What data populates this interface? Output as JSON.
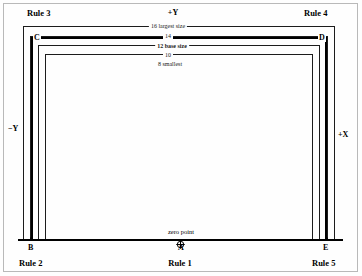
{
  "diagram": {
    "axes": {
      "top": "+Y",
      "left": "−Y",
      "right": "+X"
    },
    "origin": {
      "caption": "zero point",
      "marker": "crosshair-circle-icon",
      "letter": "A"
    },
    "corners": [
      {
        "letter": "C",
        "position": "top-left"
      },
      {
        "letter": "D",
        "position": "top-right"
      },
      {
        "letter": "B",
        "position": "bottom-left"
      },
      {
        "letter": "A",
        "position": "bottom-center"
      },
      {
        "letter": "E",
        "position": "bottom-right"
      }
    ],
    "rules": [
      {
        "id": "rule-1",
        "label": "Rule 1"
      },
      {
        "id": "rule-2",
        "label": "Rule 2"
      },
      {
        "id": "rule-3",
        "label": "Rule 3"
      },
      {
        "id": "rule-4",
        "label": "Rule 4"
      },
      {
        "id": "rule-5",
        "label": "Rule 5"
      }
    ],
    "sizes": [
      {
        "value": "16",
        "label": "16 largest size",
        "emphasis": "normal"
      },
      {
        "value": "14",
        "label": "14",
        "emphasis": "normal"
      },
      {
        "value": "12",
        "label": "12 base size",
        "emphasis": "bold"
      },
      {
        "value": "10",
        "label": "10",
        "emphasis": "normal"
      },
      {
        "value": "8",
        "label": "8 smallest",
        "emphasis": "normal"
      }
    ],
    "colors": {
      "ink": "#1c1c1c",
      "emphasis": "#000000",
      "page_border": "#b9b9b9",
      "background": "#fefefe"
    }
  }
}
